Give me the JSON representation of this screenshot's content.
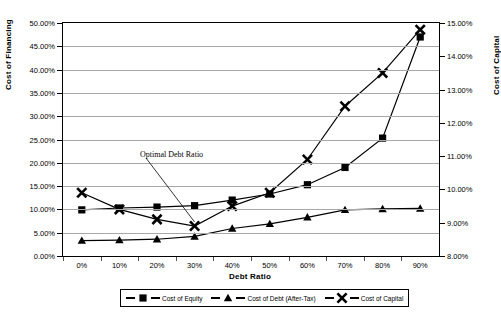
{
  "chart_data": {
    "type": "line",
    "title": "",
    "xlabel": "Debt Ratio",
    "ylabel": "Cost of Financing",
    "y2label": "Cost of Capital",
    "categories": [
      "0%",
      "10%",
      "20%",
      "30%",
      "40%",
      "50%",
      "60%",
      "70%",
      "80%",
      "90%"
    ],
    "x_values": [
      0,
      10,
      20,
      30,
      40,
      50,
      60,
      70,
      80,
      90
    ],
    "ylim": [
      0,
      50
    ],
    "y2lim": [
      8,
      15
    ],
    "y_ticks": [
      "0.00%",
      "5.00%",
      "10.00%",
      "15.00%",
      "20.00%",
      "25.00%",
      "30.00%",
      "35.00%",
      "40.00%",
      "45.00%",
      "50.00%"
    ],
    "y2_ticks": [
      "8.00%",
      "9.00%",
      "10.00%",
      "11.00%",
      "12.00%",
      "13.00%",
      "14.00%",
      "15.00%"
    ],
    "grid": true,
    "legend_position": "bottom",
    "series": [
      {
        "name": "Cost of Equity",
        "axis": "left",
        "marker": "square",
        "values": [
          9.9,
          10.3,
          10.5,
          10.8,
          12.0,
          13.3,
          15.3,
          19.0,
          25.3,
          47.0
        ]
      },
      {
        "name": "Cost of Debt (After-Tax)",
        "axis": "left",
        "marker": "triangle",
        "values": [
          3.3,
          3.4,
          3.6,
          4.2,
          5.9,
          6.9,
          8.3,
          9.9,
          10.1,
          10.2
        ]
      },
      {
        "name": "Cost of Capital",
        "axis": "right",
        "marker": "cross",
        "values": [
          9.9,
          9.4,
          9.1,
          8.9,
          9.5,
          9.9,
          10.9,
          12.5,
          13.5,
          14.8
        ]
      }
    ],
    "annotations": [
      {
        "text": "Optimal Debt Ratio",
        "target_category": "30%"
      }
    ],
    "colors": {
      "series": "#000000",
      "grid": "#a8a8a8",
      "axis": "#000000",
      "background": "#ffffff"
    }
  }
}
